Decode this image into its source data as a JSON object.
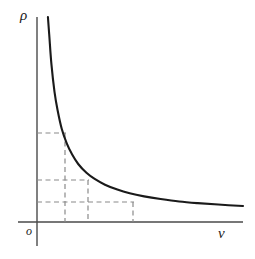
{
  "figure": {
    "kind": "line-plot",
    "background_color": "#ffffff",
    "axis_color": "#4a4a4a",
    "curve_color": "#1a1a1a",
    "dash_color": "#8a8a8a"
  },
  "labels": {
    "y_axis": "ρ",
    "x_axis": "ν",
    "origin": "o"
  },
  "chart_data": {
    "type": "line",
    "title": "",
    "xlabel": "ν",
    "ylabel": "ρ",
    "xlim": [
      0,
      1
    ],
    "ylim": [
      0,
      1
    ],
    "grid": false,
    "legend": null,
    "series": [
      {
        "name": "ρ(ν)",
        "style": "solid",
        "color": "#1a1a1a",
        "x": [
          0.053,
          0.06,
          0.07,
          0.085,
          0.1,
          0.12,
          0.145,
          0.17,
          0.2,
          0.24,
          0.28,
          0.33,
          0.39,
          0.45,
          0.52,
          0.6,
          0.69,
          0.78,
          0.88,
          1.0
        ],
        "y": [
          1.0,
          0.905,
          0.77,
          0.635,
          0.545,
          0.455,
          0.382,
          0.33,
          0.283,
          0.24,
          0.21,
          0.182,
          0.158,
          0.14,
          0.125,
          0.112,
          0.1,
          0.092,
          0.085,
          0.078
        ]
      }
    ],
    "annotations": [
      {
        "name": "construction-line-1",
        "style": "dashed",
        "x": 0.148,
        "y": 0.437,
        "note": "First marked point: horizontal dash to ρ-axis, vertical dash to ν-axis"
      },
      {
        "name": "construction-line-2",
        "style": "dashed",
        "x": 0.268,
        "y": 0.213,
        "note": "Second marked point: horizontal dash to ρ-axis, vertical dash to ν-axis"
      },
      {
        "name": "construction-line-3",
        "style": "dashed",
        "x": 0.5,
        "y": 0.106,
        "note": "Third marked point: horizontal dash to ρ-axis, vertical dash to ν-axis"
      }
    ]
  }
}
